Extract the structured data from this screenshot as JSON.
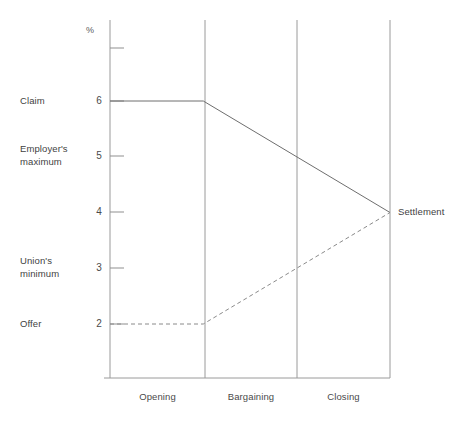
{
  "chart_data": {
    "type": "line",
    "title": "",
    "subtitle": "",
    "xlabel": "",
    "ylabel": "%",
    "ylim": [
      0,
      7.5
    ],
    "grid": false,
    "legend_position": "none",
    "categories": [
      "Opening",
      "Bargaining",
      "Closing"
    ],
    "x_boundaries": [
      0,
      1,
      2,
      3
    ],
    "ytick_values": [
      2,
      3,
      4,
      5,
      6,
      7
    ],
    "ytick_labels": [
      "2",
      "3",
      "4",
      "5",
      "6",
      ""
    ],
    "series": [
      {
        "name": "Claim",
        "style": "solid",
        "color": "#6e6e6e",
        "x": [
          0,
          1,
          3
        ],
        "values": [
          6,
          6,
          4
        ]
      },
      {
        "name": "Offer",
        "style": "dashed",
        "color": "#8a8a8a",
        "x": [
          0,
          1,
          3
        ],
        "values": [
          2,
          2,
          4
        ]
      }
    ],
    "annotations": [
      {
        "text": "Claim",
        "value": 6,
        "side": "left"
      },
      {
        "text": "Employer's\nmaximum",
        "value": 5,
        "side": "left"
      },
      {
        "text": "Union's\nminimum",
        "value": 3,
        "side": "left"
      },
      {
        "text": "Offer",
        "value": 2,
        "side": "left"
      },
      {
        "text": "Settlement",
        "value": 4,
        "side": "right"
      }
    ]
  },
  "axis": {
    "unit_label": "%",
    "ticks": [
      {
        "label": "",
        "value": 7
      },
      {
        "label": "6",
        "value": 6
      },
      {
        "label": "5",
        "value": 5
      },
      {
        "label": "4",
        "value": 4
      },
      {
        "label": "3",
        "value": 3
      },
      {
        "label": "2",
        "value": 2
      }
    ]
  },
  "annotations": {
    "claim": "Claim",
    "employers_maximum": "Employer's\nmaximum",
    "unions_minimum": "Union's\nminimum",
    "offer": "Offer",
    "settlement": "Settlement"
  },
  "phases": {
    "opening": "Opening",
    "bargaining": "Bargaining",
    "closing": "Closing"
  },
  "colors": {
    "background": "#ffffff",
    "axis": "#9a9a9a",
    "claim_line": "#6e6e6e",
    "offer_line": "#8a8a8a",
    "text": "#3f3f3f"
  }
}
